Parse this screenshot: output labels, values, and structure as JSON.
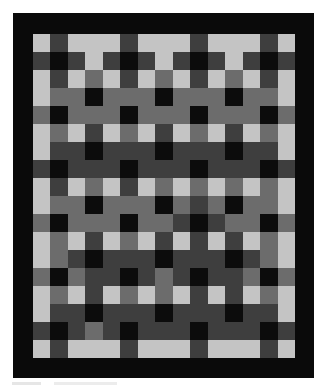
{
  "image": {
    "subject": "Photograph of a patchwork quilt with a grid of square blocks in grayscale tones and a wide black border",
    "width": 327,
    "height": 389
  },
  "quilt": {
    "border_color": "#0a0a0a",
    "columns": 15,
    "rows": 18,
    "palette": {
      "L": "#c4c4c4",
      "M": "#6c6c6c",
      "D": "#3e3e3e",
      "K": "#0c0c0c"
    },
    "grid": [
      [
        "L",
        "D",
        "L",
        "L",
        "L",
        "D",
        "L",
        "L",
        "L",
        "D",
        "L",
        "L",
        "L",
        "D",
        "L"
      ],
      [
        "D",
        "K",
        "D",
        "L",
        "D",
        "K",
        "D",
        "L",
        "D",
        "K",
        "D",
        "L",
        "D",
        "K",
        "D"
      ],
      [
        "L",
        "D",
        "L",
        "M",
        "L",
        "D",
        "L",
        "M",
        "L",
        "D",
        "L",
        "M",
        "L",
        "D",
        "L"
      ],
      [
        "L",
        "M",
        "M",
        "K",
        "M",
        "M",
        "M",
        "K",
        "M",
        "M",
        "M",
        "K",
        "M",
        "M",
        "L"
      ],
      [
        "M",
        "K",
        "M",
        "M",
        "M",
        "K",
        "M",
        "M",
        "M",
        "K",
        "M",
        "M",
        "M",
        "K",
        "M"
      ],
      [
        "L",
        "M",
        "L",
        "D",
        "L",
        "M",
        "L",
        "D",
        "L",
        "M",
        "L",
        "D",
        "L",
        "M",
        "L"
      ],
      [
        "L",
        "D",
        "D",
        "K",
        "D",
        "D",
        "D",
        "K",
        "D",
        "D",
        "D",
        "K",
        "D",
        "D",
        "L"
      ],
      [
        "D",
        "K",
        "D",
        "D",
        "D",
        "K",
        "D",
        "D",
        "D",
        "K",
        "D",
        "D",
        "D",
        "K",
        "D"
      ],
      [
        "L",
        "D",
        "L",
        "M",
        "L",
        "D",
        "L",
        "M",
        "L",
        "M",
        "L",
        "M",
        "L",
        "M",
        "L"
      ],
      [
        "L",
        "M",
        "M",
        "K",
        "M",
        "M",
        "M",
        "K",
        "M",
        "D",
        "M",
        "K",
        "M",
        "M",
        "L"
      ],
      [
        "M",
        "K",
        "M",
        "M",
        "M",
        "K",
        "M",
        "M",
        "D",
        "K",
        "D",
        "M",
        "M",
        "K",
        "M"
      ],
      [
        "L",
        "M",
        "L",
        "D",
        "L",
        "M",
        "L",
        "D",
        "L",
        "D",
        "L",
        "D",
        "L",
        "M",
        "L"
      ],
      [
        "L",
        "M",
        "D",
        "K",
        "D",
        "D",
        "D",
        "K",
        "D",
        "D",
        "D",
        "K",
        "D",
        "M",
        "L"
      ],
      [
        "M",
        "K",
        "M",
        "D",
        "D",
        "K",
        "D",
        "M",
        "D",
        "K",
        "D",
        "D",
        "M",
        "K",
        "M"
      ],
      [
        "L",
        "M",
        "L",
        "D",
        "L",
        "M",
        "L",
        "M",
        "L",
        "D",
        "L",
        "D",
        "L",
        "M",
        "L"
      ],
      [
        "L",
        "D",
        "D",
        "K",
        "D",
        "D",
        "D",
        "K",
        "D",
        "D",
        "D",
        "K",
        "D",
        "D",
        "L"
      ],
      [
        "D",
        "K",
        "D",
        "M",
        "D",
        "K",
        "D",
        "D",
        "D",
        "K",
        "D",
        "D",
        "D",
        "K",
        "D"
      ],
      [
        "L",
        "D",
        "L",
        "L",
        "L",
        "D",
        "L",
        "L",
        "L",
        "D",
        "L",
        "L",
        "L",
        "D",
        "L"
      ]
    ]
  }
}
